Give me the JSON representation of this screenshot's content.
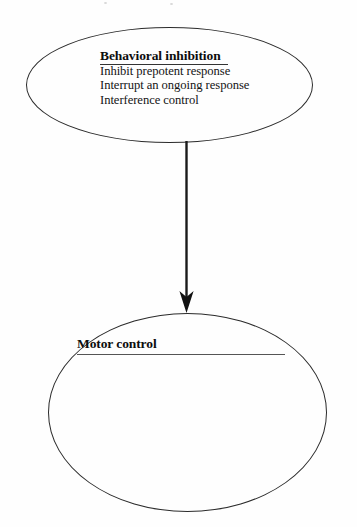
{
  "diagram": {
    "type": "flow-diagram",
    "background_color": "#fefefe",
    "stroke_color": "#2b2b2b",
    "text_color": "#111111",
    "nodes": [
      {
        "id": "behavioral-inhibition",
        "shape": "ellipse",
        "title": "Behavioral inhibition",
        "title_underlined": true,
        "lines": [
          "Inhibit prepotent response",
          "Interrupt an ongoing response",
          "Interference control"
        ]
      },
      {
        "id": "motor-control",
        "shape": "ellipse",
        "title": "Motor control",
        "title_underlined": true,
        "lines": []
      }
    ],
    "edges": [
      {
        "id": "inhibition-to-motor-control",
        "from": "behavioral-inhibition",
        "to": "motor-control",
        "style": "solid",
        "arrowhead": "filled-triangle",
        "direction": "down"
      }
    ]
  }
}
